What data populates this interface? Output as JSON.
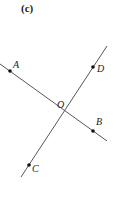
{
  "figure": {
    "caption": "(c)",
    "colors": {
      "line": "#444444",
      "point": "#111111",
      "text": "#222222",
      "background": "#ffffff"
    },
    "lines": [
      {
        "name": "AB",
        "x1": 0,
        "y1": 64,
        "x2": 107,
        "y2": 141
      },
      {
        "name": "CD",
        "x1": 107,
        "y1": 46,
        "x2": 21,
        "y2": 177
      }
    ],
    "points": {
      "A": {
        "label": "A",
        "x": 10,
        "y": 71,
        "lx": 13,
        "ly": 68
      },
      "B": {
        "label": "B",
        "x": 93,
        "y": 131,
        "lx": 96,
        "ly": 125
      },
      "C": {
        "label": "C",
        "x": 29,
        "y": 165,
        "lx": 32,
        "ly": 172
      },
      "D": {
        "label": "D",
        "x": 93,
        "y": 67,
        "lx": 97,
        "ly": 72
      },
      "O": {
        "label": "O",
        "x": 65,
        "y": 111,
        "lx": 57,
        "ly": 108
      }
    }
  }
}
